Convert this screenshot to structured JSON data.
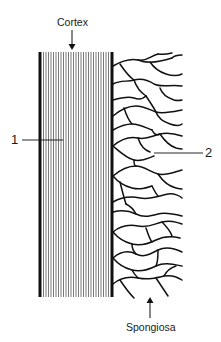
{
  "labels": {
    "cortex": "Cortex",
    "spongiosa": "Spongiosa",
    "marker_1": "1",
    "marker_2": "2"
  },
  "colors": {
    "ink": "#111111",
    "background": "#ffffff"
  }
}
